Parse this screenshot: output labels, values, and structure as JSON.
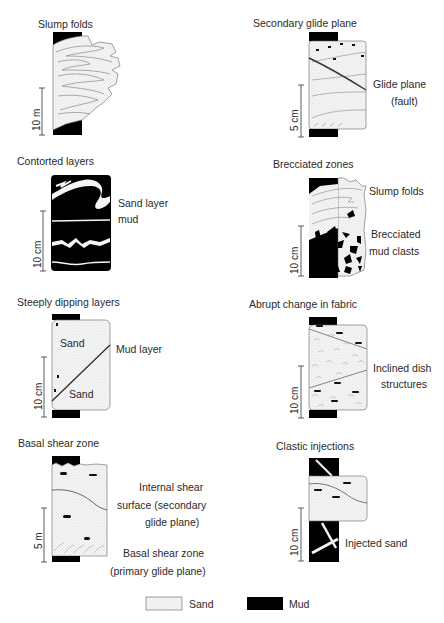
{
  "panels": {
    "slump_folds": {
      "title": "Slump folds",
      "scale": "10 m"
    },
    "secondary_glide_plane": {
      "title": "Secondary glide plane",
      "scale": "5 cm",
      "labels": [
        "Glide plane",
        "(fault)"
      ]
    },
    "contorted_layers": {
      "title": "Contorted layers",
      "scale": "10 cm",
      "labels": [
        "Sand layer",
        "mud"
      ]
    },
    "brecciated_zones": {
      "title": "Brecciated zones",
      "scale": "10 cm",
      "labels": [
        "Slump folds",
        "Brecciated",
        "mud clasts"
      ]
    },
    "steeply_dipping_layers": {
      "title": "Steeply dipping layers",
      "scale": "10 cm",
      "labels": [
        "Sand",
        "Sand",
        "Mud layer"
      ]
    },
    "abrupt_change_in_fabric": {
      "title": "Abrupt change in fabric",
      "scale": "10 cm",
      "labels": [
        "Inclined dish",
        "structures"
      ]
    },
    "basal_shear_zone": {
      "title": "Basal shear zone",
      "scale": "5 m",
      "labels": [
        "Internal shear",
        "surface (secondary",
        "glide plane)",
        "Basal shear zone",
        "(primary glide plane)"
      ]
    },
    "clastic_injections": {
      "title": "Clastic injections",
      "scale": "10 cm",
      "labels": [
        "Injected sand"
      ]
    }
  },
  "legend": {
    "items": [
      {
        "label": "Sand",
        "pattern": "stippled",
        "color": "#f4f4f4"
      },
      {
        "label": "Mud",
        "pattern": "solid",
        "color": "#000000"
      }
    ]
  },
  "colors": {
    "mud": "#000000",
    "sand": "#f6f6f6",
    "line": "#555555"
  }
}
